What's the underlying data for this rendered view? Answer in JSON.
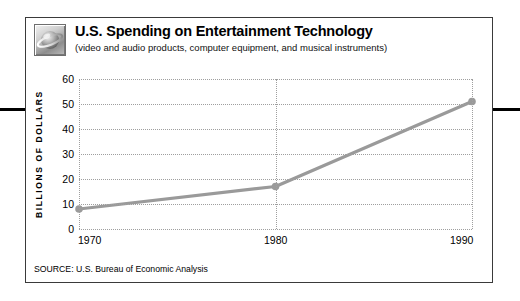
{
  "figure": {
    "icon_name": "planet-sphere-icon",
    "title": "U.S. Spending on Entertainment Technology",
    "subtitle": "(video and audio products, computer equipment, and musical instruments)",
    "source": "SOURCE: U.S. Bureau of Economic Analysis"
  },
  "colors": {
    "line": "#9a9a9a",
    "marker": "#9a9a9a",
    "grid": "#9f9f9f",
    "frame": "#3a3a3a",
    "edge_rule": "#000000",
    "text": "#000000"
  },
  "chart_data": {
    "type": "line",
    "title": "U.S. Spending on Entertainment Technology",
    "subtitle": "(video and audio products, computer equipment, and musical instruments)",
    "xlabel": "",
    "ylabel": "BILLIONS OF DOLLARS",
    "x": [
      1970,
      1980,
      1990
    ],
    "xticklabels": [
      "1970",
      "1980",
      "1990"
    ],
    "values": [
      8,
      17,
      51
    ],
    "yticks": [
      0,
      10,
      20,
      30,
      40,
      50,
      60
    ],
    "yticklabels": [
      "0",
      "10",
      "20",
      "30",
      "40",
      "50",
      "60"
    ],
    "ylim": [
      0,
      60
    ],
    "xlim": [
      1970,
      1990
    ],
    "grid": "dotted horizontal and vertical",
    "legend": "none",
    "markers": "round dots",
    "series": [
      {
        "name": "U.S. spending on entertainment technology",
        "values": [
          8,
          17,
          51
        ]
      }
    ]
  }
}
